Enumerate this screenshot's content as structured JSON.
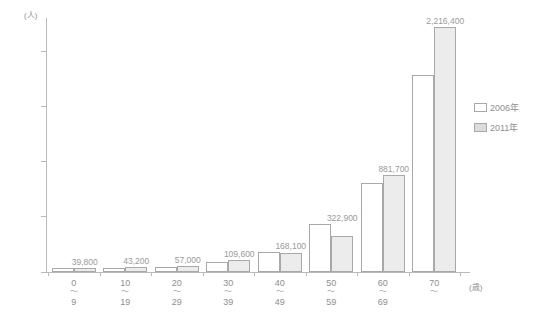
{
  "chart_data": {
    "type": "bar",
    "title": "",
    "xlabel": "(歳)",
    "ylabel": "(人)",
    "ylim": [
      0,
      2300000
    ],
    "grid": false,
    "legend_position": "right",
    "categories": [
      "0\n9",
      "10\n19",
      "20\n29",
      "30\n39",
      "40\n49",
      "50\n59",
      "60\n69",
      "70\n"
    ],
    "category_parts": [
      {
        "lo": "0",
        "tilde": "～",
        "hi": "9"
      },
      {
        "lo": "10",
        "tilde": "～",
        "hi": "19"
      },
      {
        "lo": "20",
        "tilde": "～",
        "hi": "29"
      },
      {
        "lo": "30",
        "tilde": "～",
        "hi": "39"
      },
      {
        "lo": "40",
        "tilde": "～",
        "hi": "49"
      },
      {
        "lo": "50",
        "tilde": "～",
        "hi": "59"
      },
      {
        "lo": "60",
        "tilde": "～",
        "hi": "69"
      },
      {
        "lo": "70",
        "tilde": "～",
        "hi": ""
      }
    ],
    "series": [
      {
        "name": "2006年",
        "color": "#ffffff",
        "values": [
          33000,
          38000,
          47000,
          92000,
          178000,
          437000,
          810000,
          1780000
        ]
      },
      {
        "name": "2011年",
        "color": "#ececec",
        "values": [
          39800,
          43200,
          57000,
          109600,
          168100,
          322900,
          881700,
          2216400
        ]
      }
    ],
    "data_labels": [
      "39,800",
      "43,200",
      "57,000",
      "109,600",
      "168,100",
      "322,900",
      "881,700",
      "2,216,400"
    ],
    "y_ticks": [
      {
        "value": 0,
        "label": "0"
      },
      {
        "value": 500000,
        "label": "50万"
      },
      {
        "value": 1000000,
        "label": "100万"
      },
      {
        "value": 1500000,
        "label": "150万"
      },
      {
        "value": 2000000,
        "label": "200万"
      }
    ]
  },
  "axes": {
    "y_unit": "(人)",
    "x_unit": "(歳)"
  },
  "legend": {
    "items": [
      {
        "label": "2006年",
        "swatch": "white-swatch"
      },
      {
        "label": "2011年",
        "swatch": "gray-swatch"
      }
    ]
  }
}
